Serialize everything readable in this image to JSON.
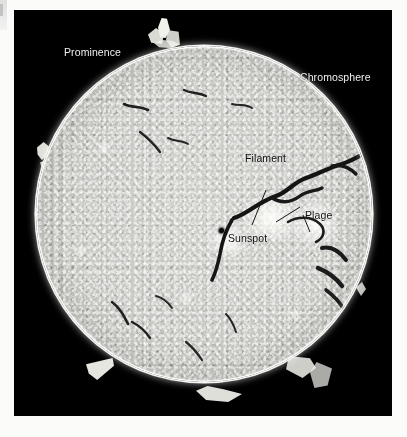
{
  "image": {
    "subject": "Sun in hydrogen-alpha light",
    "background_color": "#000000",
    "mount_color": "#fbfbfa",
    "disk_color": "#c9c9c5",
    "photo_area": {
      "x": 14,
      "y": 10,
      "width": 378,
      "height": 406
    },
    "disk": {
      "center_x": 204,
      "center_y": 218,
      "radius": 168
    }
  },
  "annotations": [
    {
      "id": "prominence",
      "label": "Prominence",
      "style": "light",
      "x": 64,
      "y": 45,
      "points_to": "upper-left limb eruption"
    },
    {
      "id": "chromosphere",
      "label": "Chromosphere",
      "style": "light",
      "x": 300,
      "y": 70,
      "points_to": "bright limb ring"
    },
    {
      "id": "filament",
      "label": "Filament",
      "style": "dark",
      "x": 245,
      "y": 150,
      "points_to": "dark snaking band"
    },
    {
      "id": "plage",
      "label": "Plage",
      "style": "dark",
      "x": 305,
      "y": 207,
      "points_to": "bright patch left of label"
    },
    {
      "id": "sunspot",
      "label": "Sunspot",
      "style": "dark",
      "x": 228,
      "y": 230,
      "points_to": "dark dot left of label"
    }
  ],
  "features": {
    "prominences": [
      {
        "name": "top-prominence",
        "x": 160,
        "y": 25,
        "w": 22,
        "h": 22
      },
      {
        "name": "left-limb-prominence",
        "x": 38,
        "y": 146,
        "w": 11,
        "h": 16
      },
      {
        "name": "lower-left-prominence",
        "x": 96,
        "y": 366,
        "w": 22,
        "h": 16
      },
      {
        "name": "bottom-prominence",
        "x": 208,
        "y": 392,
        "w": 34,
        "h": 14
      },
      {
        "name": "lower-right-prominence",
        "x": 300,
        "y": 365,
        "w": 26,
        "h": 18
      },
      {
        "name": "right-limb-prominence",
        "x": 358,
        "y": 290,
        "w": 10,
        "h": 12
      }
    ],
    "sunspot": {
      "x": 221,
      "y": 230,
      "diameter": 5
    },
    "plage_regions": [
      {
        "x": 238,
        "y": 196,
        "w": 62,
        "h": 34
      },
      {
        "x": 290,
        "y": 200,
        "w": 44,
        "h": 40
      },
      {
        "x": 206,
        "y": 222,
        "w": 34,
        "h": 26
      }
    ]
  }
}
